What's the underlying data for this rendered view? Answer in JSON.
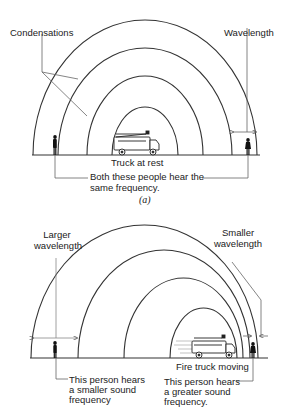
{
  "panel_a": {
    "label_condensations": "Condensations",
    "label_wavelength": "Wavelength",
    "label_truck": "Truck at rest",
    "label_both_line1": "Both these people hear the",
    "label_both_line2": "same frequency.",
    "caption": "(a)",
    "wavefront_count": 4
  },
  "panel_b": {
    "label_larger_line1": "Larger",
    "label_larger_line2": "wavelength",
    "label_smaller_line1": "Smaller",
    "label_smaller_line2": "wavelength",
    "label_truck": "Fire truck moving",
    "label_left_line1": "This person hears",
    "label_left_line2": "a smaller sound",
    "label_left_line3": "frequency",
    "label_right_line1": "This person hears",
    "label_right_line2": "a greater sound",
    "label_right_line3": "frequency.",
    "wavefront_count": 4
  },
  "colors": {
    "line": "#333333",
    "text": "#222222",
    "background": "#ffffff"
  }
}
